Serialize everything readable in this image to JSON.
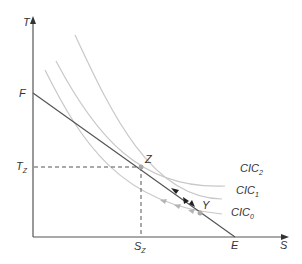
{
  "diagram": {
    "axes": {
      "y_label": "T",
      "x_label": "S"
    },
    "points": {
      "F": "F",
      "E": "E",
      "Z": "Z",
      "Y": "Y"
    },
    "ticks": {
      "Tz_main": "T",
      "Tz_sub": "Z",
      "Sz_main": "S",
      "Sz_sub": "Z"
    },
    "curves": [
      {
        "id": "CIC2",
        "main": "CIC",
        "sub": "2"
      },
      {
        "id": "CIC1",
        "main": "CIC",
        "sub": "1"
      },
      {
        "id": "CIC0",
        "main": "CIC",
        "sub": "0"
      }
    ],
    "colors": {
      "axis": "#555555",
      "budget_line": "#555555",
      "curves": "#c8c8c8",
      "point": "#aaaaaa",
      "arrows_black": "#222222",
      "arrows_grey": "#b5b5b5"
    }
  }
}
